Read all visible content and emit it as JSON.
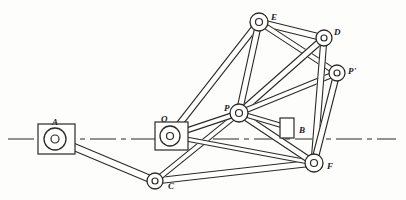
{
  "figure": {
    "background_color": "#fdfdfc",
    "ink_color": "#23211f",
    "line_color": "#2b2926",
    "fill_color": "#ffffff"
  },
  "centerline": {
    "name": "horizontal-datum-line",
    "y": 139,
    "x_start": 8,
    "x_end": 396,
    "style": "dash-dot"
  },
  "joints": [
    {
      "id": "A",
      "label": "A",
      "x": 55,
      "y": 139,
      "r_outer": 11,
      "r_inner": 4,
      "label_x": 52,
      "label_y": 118,
      "grounded": true
    },
    {
      "id": "O",
      "label": "O",
      "x": 170,
      "y": 136,
      "r_outer": 10,
      "r_inner": 3.5,
      "label_x": 161,
      "label_y": 115,
      "grounded": true
    },
    {
      "id": "C",
      "label": "C",
      "x": 155,
      "y": 181,
      "r_outer": 8,
      "r_inner": 3,
      "label_x": 168,
      "label_y": 182,
      "grounded": false
    },
    {
      "id": "P",
      "label": "P",
      "x": 239,
      "y": 113,
      "r_outer": 9,
      "r_inner": 3.5,
      "label_x": 224,
      "label_y": 104,
      "grounded": false
    },
    {
      "id": "E",
      "label": "E",
      "x": 259,
      "y": 22,
      "r_outer": 9,
      "r_inner": 3.5,
      "label_x": 271,
      "label_y": 13,
      "grounded": false
    },
    {
      "id": "D",
      "label": "D",
      "x": 324,
      "y": 38,
      "r_outer": 8,
      "r_inner": 3,
      "label_x": 334,
      "label_y": 28,
      "grounded": false
    },
    {
      "id": "Pp",
      "label": "P'",
      "x": 337,
      "y": 73,
      "r_outer": 8,
      "r_inner": 3,
      "label_x": 348,
      "label_y": 67,
      "grounded": false
    },
    {
      "id": "F",
      "label": "F",
      "x": 314,
      "y": 163,
      "r_outer": 9,
      "r_inner": 3.5,
      "label_x": 327,
      "label_y": 162,
      "grounded": false
    },
    {
      "id": "B",
      "label": "B",
      "x": 290,
      "y": 128,
      "r_outer": 0,
      "r_inner": 0,
      "label_x": 299,
      "label_y": 126,
      "grounded": false
    }
  ],
  "ground_blocks": [
    {
      "name": "ground-block-a",
      "x": 38,
      "y": 124,
      "width": 37,
      "height": 30,
      "joint": "A"
    },
    {
      "name": "ground-block-o",
      "x": 155,
      "y": 122,
      "width": 33,
      "height": 28,
      "joint": "O"
    }
  ],
  "slider_block": {
    "name": "slider-block-b",
    "x": 280,
    "y": 118,
    "width": 14,
    "height": 20,
    "joint": "B"
  },
  "links": [
    {
      "name": "link-a-c",
      "from": "A",
      "to": "C",
      "width": 7,
      "desc": "crank A to C"
    },
    {
      "name": "link-c-f",
      "from": "C",
      "to": "F",
      "width": 6,
      "desc": "long coupler C to F"
    },
    {
      "name": "link-c-p",
      "from": "C",
      "to": "P",
      "width": 5,
      "desc": "C to P"
    },
    {
      "name": "link-o-p",
      "from": "O",
      "to": "P",
      "width": 5,
      "desc": "O to P"
    },
    {
      "name": "link-o-f",
      "from": "O",
      "to": "F",
      "width": 4,
      "desc": "O to F lower bar"
    },
    {
      "name": "link-o-e",
      "from": "O",
      "to": "E",
      "width": 6,
      "desc": "O to E long riser"
    },
    {
      "name": "link-p-e",
      "from": "P",
      "to": "E",
      "width": 6,
      "desc": "P to E"
    },
    {
      "name": "link-e-d",
      "from": "E",
      "to": "D",
      "width": 6,
      "desc": "E to D top bar"
    },
    {
      "name": "link-e-pp",
      "from": "E",
      "to": "Pp",
      "width": 5,
      "desc": "E to P prime"
    },
    {
      "name": "link-p-d",
      "from": "P",
      "to": "D",
      "width": 6,
      "desc": "P to D diagonal"
    },
    {
      "name": "link-p-pp",
      "from": "P",
      "to": "Pp",
      "width": 5,
      "desc": "P to P prime"
    },
    {
      "name": "link-d-f",
      "from": "D",
      "to": "F",
      "width": 6,
      "desc": "D to F"
    },
    {
      "name": "link-pp-f",
      "from": "Pp",
      "to": "F",
      "width": 6,
      "desc": "P prime to F"
    },
    {
      "name": "link-p-f",
      "from": "P",
      "to": "F",
      "width": 6,
      "desc": "P to F through slider"
    },
    {
      "name": "link-p-b",
      "from": "P",
      "to": "B",
      "width": 4,
      "desc": "P to slider B"
    }
  ]
}
